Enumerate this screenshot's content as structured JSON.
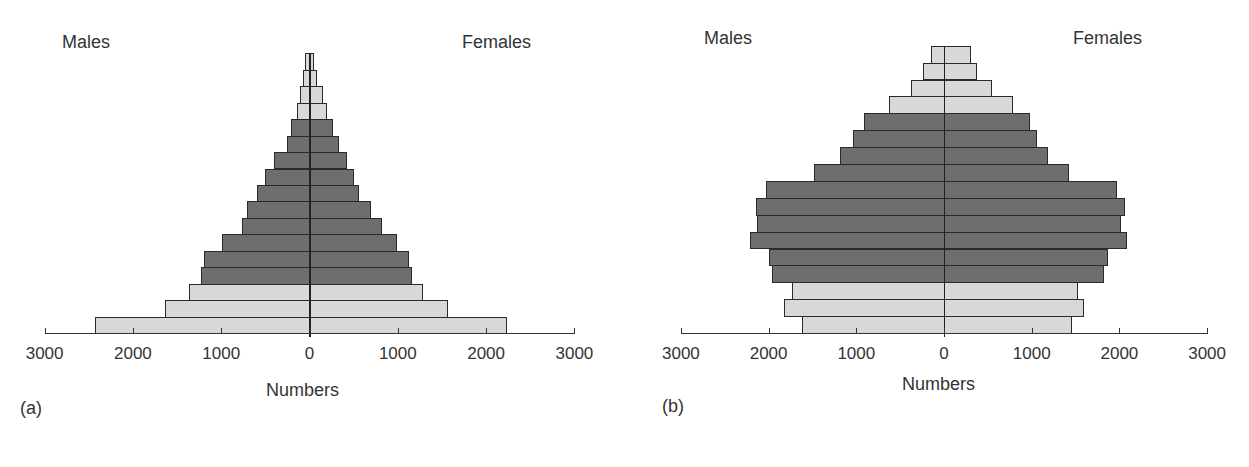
{
  "chart_data": [
    {
      "type": "bar",
      "subtype": "population-pyramid",
      "panel_label": "(a)",
      "xlabel": "Numbers",
      "left_label": "Males",
      "right_label": "Females",
      "xlim": [
        -3000,
        3000
      ],
      "xticks": [
        3000,
        2000,
        1000,
        0,
        1000,
        2000,
        3000
      ],
      "categories_bottom_to_top": [
        "1",
        "2",
        "3",
        "4",
        "5",
        "6",
        "7",
        "8",
        "9",
        "10",
        "11",
        "12",
        "13",
        "14",
        "15",
        "16",
        "17"
      ],
      "series": [
        {
          "name": "Males",
          "values": [
            2430,
            1640,
            1360,
            1230,
            1200,
            990,
            760,
            710,
            590,
            500,
            400,
            260,
            210,
            140,
            110,
            75,
            50
          ]
        },
        {
          "name": "Females",
          "values": [
            2240,
            1570,
            1280,
            1160,
            1130,
            990,
            820,
            700,
            560,
            500,
            430,
            330,
            270,
            200,
            150,
            80,
            50
          ]
        }
      ],
      "shade": [
        "light",
        "light",
        "light",
        "dark",
        "dark",
        "dark",
        "dark",
        "dark",
        "dark",
        "dark",
        "dark",
        "dark",
        "dark",
        "light",
        "light",
        "light",
        "light"
      ],
      "grid": false
    },
    {
      "type": "bar",
      "subtype": "population-pyramid",
      "panel_label": "(b)",
      "xlabel": "Numbers",
      "left_label": "Males",
      "right_label": "Females",
      "xlim": [
        -3000,
        3000
      ],
      "xticks": [
        3000,
        2000,
        1000,
        0,
        1000,
        2000,
        3000
      ],
      "categories_bottom_to_top": [
        "1",
        "2",
        "3",
        "4",
        "5",
        "6",
        "7",
        "8",
        "9",
        "10",
        "11",
        "12",
        "13",
        "14",
        "15",
        "16",
        "17"
      ],
      "series": [
        {
          "name": "Males",
          "values": [
            1620,
            1820,
            1730,
            1960,
            1990,
            2210,
            2130,
            2140,
            2030,
            1480,
            1190,
            1040,
            910,
            630,
            380,
            240,
            150
          ]
        },
        {
          "name": "Females",
          "values": [
            1460,
            1600,
            1530,
            1830,
            1870,
            2090,
            2020,
            2060,
            1970,
            1430,
            1190,
            1060,
            980,
            790,
            550,
            380,
            310
          ]
        }
      ],
      "shade": [
        "light",
        "light",
        "light",
        "dark",
        "dark",
        "dark",
        "dark",
        "dark",
        "dark",
        "dark",
        "dark",
        "dark",
        "dark",
        "light",
        "light",
        "light",
        "light"
      ],
      "grid": false
    }
  ],
  "colors": {
    "dark": "#6e6e6e",
    "light": "#d8d8d8",
    "outline": "#2a2a2a"
  },
  "panels": [
    {
      "label": "(a)",
      "males": "Males",
      "females": "Females",
      "xlabel": "Numbers",
      "ticks": [
        "3000",
        "2000",
        "1000",
        "0",
        "1000",
        "2000",
        "3000"
      ]
    },
    {
      "label": "(b)",
      "males": "Males",
      "females": "Females",
      "xlabel": "Numbers",
      "ticks": [
        "3000",
        "2000",
        "1000",
        "0",
        "1000",
        "2000",
        "3000"
      ]
    }
  ]
}
